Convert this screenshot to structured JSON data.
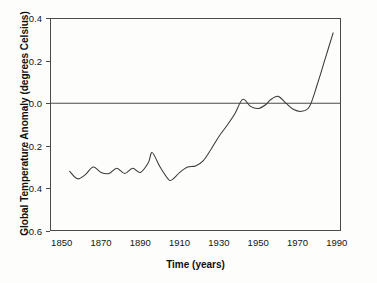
{
  "chart_data": {
    "type": "line",
    "title": "",
    "xlabel": "Time (years)",
    "ylabel": "Global Temperature Anomaly (degrees Celsius)",
    "xlim": [
      1846,
      1994
    ],
    "ylim": [
      -0.6,
      0.4
    ],
    "grid": false,
    "legend": "none",
    "zero_reference_line": true,
    "xticks": [
      "1850",
      "1870",
      "1890",
      "1910",
      "1930",
      "1950",
      "1970",
      "1990"
    ],
    "xtick_values": [
      1850,
      1870,
      1890,
      1910,
      1930,
      1950,
      1970,
      1990
    ],
    "yticks": [
      "0.4",
      "0.2",
      "0.0",
      "-0.2",
      "-0.4",
      "-0.6"
    ],
    "ytick_values": [
      0.4,
      0.2,
      0.0,
      -0.2,
      -0.4,
      -0.6
    ],
    "series": [
      {
        "name": "Global temperature anomaly",
        "color": "#3a3a3a",
        "x": [
          1856,
          1860,
          1864,
          1868,
          1872,
          1876,
          1880,
          1884,
          1888,
          1892,
          1896,
          1898,
          1902,
          1906,
          1908,
          1912,
          1916,
          1920,
          1924,
          1928,
          1932,
          1936,
          1940,
          1944,
          1948,
          1952,
          1956,
          1958,
          1962,
          1966,
          1970,
          1974,
          1978,
          1982,
          1986,
          1990
        ],
        "values": [
          -0.32,
          -0.355,
          -0.335,
          -0.3,
          -0.325,
          -0.33,
          -0.305,
          -0.33,
          -0.305,
          -0.325,
          -0.28,
          -0.232,
          -0.3,
          -0.355,
          -0.36,
          -0.325,
          -0.3,
          -0.295,
          -0.27,
          -0.215,
          -0.155,
          -0.105,
          -0.05,
          0.018,
          -0.015,
          -0.025,
          -0.005,
          0.015,
          0.032,
          0.0,
          -0.03,
          -0.038,
          -0.015,
          0.09,
          0.21,
          0.33
        ]
      }
    ],
    "annotations": []
  },
  "axes": {
    "y_tick_labels": [
      "0.4",
      "0.2",
      "0.0",
      "-0.2",
      "-0.4",
      "-0.6"
    ],
    "x_tick_labels": [
      "1850",
      "1870",
      "1890",
      "1910",
      "1930",
      "1950",
      "1970",
      "1990"
    ],
    "x_axis_title": "Time (years)",
    "y_axis_title": "Global Temperature Anomaly (degrees Celsius)"
  }
}
